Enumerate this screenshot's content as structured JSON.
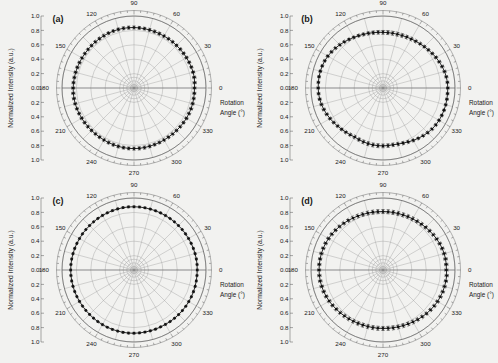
{
  "figure": {
    "background_color": "#f2f2f0",
    "axis_color": "#1a1a1a",
    "data_color": "#111111",
    "grid_color": "#9a9a9a"
  },
  "common": {
    "ylabel": "Normalized Intensity (a.u.)",
    "rotation_label_line1": "Rotation",
    "rotation_label_line2": "Angle (°)",
    "ytick_labels": [
      "1.0",
      "0.8",
      "0.6",
      "0.4",
      "0.2",
      "0.0",
      "0.2",
      "0.4",
      "0.6",
      "0.8",
      "1.0"
    ],
    "angle_ticks": [
      "0",
      "30",
      "60",
      "90",
      "120",
      "150",
      "180",
      "210",
      "240",
      "270",
      "300",
      "330"
    ]
  },
  "panels": [
    {
      "label": "(a)"
    },
    {
      "label": "(b)"
    },
    {
      "label": "(c)"
    },
    {
      "label": "(d)"
    }
  ],
  "chart_data": [
    {
      "type": "line",
      "subplot": "(a)",
      "title": "(a)",
      "xlabel": "Rotation Angle (°)",
      "ylabel": "Normalized Intensity (a.u.)",
      "projection": "polar",
      "rlim": [
        0,
        1.0
      ],
      "r_ticks": [
        0.2,
        0.4,
        0.6,
        0.8,
        1.0
      ],
      "theta_ticks": [
        0,
        30,
        60,
        90,
        120,
        150,
        180,
        210,
        240,
        270,
        300,
        330
      ],
      "grid": true,
      "legend": "none",
      "theta": [
        0,
        5,
        10,
        15,
        20,
        25,
        30,
        35,
        40,
        45,
        50,
        55,
        60,
        65,
        70,
        75,
        80,
        85,
        90,
        95,
        100,
        105,
        110,
        115,
        120,
        125,
        130,
        135,
        140,
        145,
        150,
        155,
        160,
        165,
        170,
        175,
        180,
        185,
        190,
        195,
        200,
        205,
        210,
        215,
        220,
        225,
        230,
        235,
        240,
        245,
        250,
        255,
        260,
        265,
        270,
        275,
        280,
        285,
        290,
        295,
        300,
        305,
        310,
        315,
        320,
        325,
        330,
        335,
        340,
        345,
        350,
        355
      ],
      "r": [
        0.84,
        0.845,
        0.85,
        0.85,
        0.848,
        0.845,
        0.842,
        0.84,
        0.838,
        0.836,
        0.835,
        0.834,
        0.833,
        0.833,
        0.834,
        0.835,
        0.837,
        0.838,
        0.84,
        0.841,
        0.842,
        0.842,
        0.841,
        0.84,
        0.838,
        0.836,
        0.835,
        0.834,
        0.833,
        0.833,
        0.834,
        0.835,
        0.837,
        0.839,
        0.841,
        0.843,
        0.845,
        0.846,
        0.846,
        0.845,
        0.843,
        0.841,
        0.839,
        0.837,
        0.835,
        0.834,
        0.833,
        0.833,
        0.834,
        0.836,
        0.838,
        0.84,
        0.841,
        0.842,
        0.842,
        0.841,
        0.84,
        0.838,
        0.836,
        0.835,
        0.834,
        0.833,
        0.834,
        0.835,
        0.837,
        0.839,
        0.841,
        0.842,
        0.843,
        0.843,
        0.842,
        0.841
      ],
      "r_error": [
        0.02,
        0.022,
        0.022,
        0.02,
        0.019,
        0.02,
        0.021,
        0.022,
        0.022,
        0.021,
        0.02,
        0.02,
        0.021,
        0.022,
        0.022,
        0.021,
        0.02,
        0.02,
        0.021,
        0.022,
        0.022,
        0.021,
        0.02,
        0.02,
        0.021,
        0.022,
        0.022,
        0.021,
        0.02,
        0.02,
        0.021,
        0.022,
        0.022,
        0.021,
        0.02,
        0.02,
        0.021,
        0.022,
        0.022,
        0.021,
        0.02,
        0.02,
        0.021,
        0.022,
        0.022,
        0.021,
        0.02,
        0.02,
        0.021,
        0.022,
        0.022,
        0.021,
        0.02,
        0.02,
        0.021,
        0.022,
        0.022,
        0.021,
        0.02,
        0.02,
        0.021,
        0.022,
        0.022,
        0.021,
        0.02,
        0.02,
        0.021,
        0.022,
        0.022,
        0.021,
        0.02,
        0.02
      ],
      "shape_note": "near-isotropic, radius ~0.84"
    },
    {
      "type": "line",
      "subplot": "(b)",
      "title": "(b)",
      "xlabel": "Rotation Angle (°)",
      "ylabel": "Normalized Intensity (a.u.)",
      "projection": "polar",
      "rlim": [
        0,
        1.0
      ],
      "r_ticks": [
        0.2,
        0.4,
        0.6,
        0.8,
        1.0
      ],
      "theta_ticks": [
        0,
        30,
        60,
        90,
        120,
        150,
        180,
        210,
        240,
        270,
        300,
        330
      ],
      "grid": true,
      "legend": "none",
      "theta": [
        0,
        5,
        10,
        15,
        20,
        25,
        30,
        35,
        40,
        45,
        50,
        55,
        60,
        65,
        70,
        75,
        80,
        85,
        90,
        95,
        100,
        105,
        110,
        115,
        120,
        125,
        130,
        135,
        140,
        145,
        150,
        155,
        160,
        165,
        170,
        175,
        180,
        185,
        190,
        195,
        200,
        205,
        210,
        215,
        220,
        225,
        230,
        235,
        240,
        245,
        250,
        255,
        260,
        265,
        270,
        275,
        280,
        285,
        290,
        295,
        300,
        305,
        310,
        315,
        320,
        325,
        330,
        335,
        340,
        345,
        350,
        355
      ],
      "r": [
        0.9,
        0.898,
        0.893,
        0.885,
        0.874,
        0.862,
        0.849,
        0.836,
        0.823,
        0.812,
        0.802,
        0.793,
        0.786,
        0.78,
        0.776,
        0.773,
        0.772,
        0.772,
        0.773,
        0.776,
        0.78,
        0.786,
        0.793,
        0.802,
        0.812,
        0.823,
        0.836,
        0.849,
        0.862,
        0.874,
        0.885,
        0.893,
        0.898,
        0.901,
        0.902,
        0.901,
        0.9,
        0.898,
        0.893,
        0.885,
        0.874,
        0.862,
        0.849,
        0.836,
        0.823,
        0.812,
        0.802,
        0.793,
        0.786,
        0.79,
        0.796,
        0.8,
        0.803,
        0.804,
        0.804,
        0.803,
        0.801,
        0.806,
        0.815,
        0.826,
        0.84,
        0.853,
        0.866,
        0.878,
        0.888,
        0.895,
        0.899,
        0.901,
        0.902,
        0.902,
        0.901,
        0.9
      ],
      "r_error": [
        0.018,
        0.019,
        0.02,
        0.021,
        0.022,
        0.022,
        0.021,
        0.02,
        0.02,
        0.021,
        0.022,
        0.023,
        0.024,
        0.025,
        0.026,
        0.027,
        0.027,
        0.027,
        0.026,
        0.025,
        0.024,
        0.023,
        0.022,
        0.021,
        0.02,
        0.02,
        0.021,
        0.022,
        0.022,
        0.021,
        0.02,
        0.019,
        0.018,
        0.018,
        0.018,
        0.018,
        0.018,
        0.019,
        0.02,
        0.021,
        0.022,
        0.022,
        0.021,
        0.02,
        0.02,
        0.021,
        0.022,
        0.023,
        0.024,
        0.025,
        0.026,
        0.027,
        0.027,
        0.027,
        0.026,
        0.025,
        0.024,
        0.023,
        0.022,
        0.021,
        0.02,
        0.02,
        0.021,
        0.022,
        0.022,
        0.021,
        0.02,
        0.019,
        0.018,
        0.018,
        0.018,
        0.018
      ],
      "shape_note": "elliptical, elongated along 0-180 axis, max ~0.90 min ~0.77"
    },
    {
      "type": "line",
      "subplot": "(c)",
      "title": "(c)",
      "xlabel": "Rotation Angle (°)",
      "ylabel": "Normalized Intensity (a.u.)",
      "projection": "polar",
      "rlim": [
        0,
        1.0
      ],
      "r_ticks": [
        0.2,
        0.4,
        0.6,
        0.8,
        1.0
      ],
      "theta_ticks": [
        0,
        30,
        60,
        90,
        120,
        150,
        180,
        210,
        240,
        270,
        300,
        330
      ],
      "grid": true,
      "legend": "none",
      "theta": [
        0,
        5,
        10,
        15,
        20,
        25,
        30,
        35,
        40,
        45,
        50,
        55,
        60,
        65,
        70,
        75,
        80,
        85,
        90,
        95,
        100,
        105,
        110,
        115,
        120,
        125,
        130,
        135,
        140,
        145,
        150,
        155,
        160,
        165,
        170,
        175,
        180,
        185,
        190,
        195,
        200,
        205,
        210,
        215,
        220,
        225,
        230,
        235,
        240,
        245,
        250,
        255,
        260,
        265,
        270,
        275,
        280,
        285,
        290,
        295,
        300,
        305,
        310,
        315,
        320,
        325,
        330,
        335,
        340,
        345,
        350,
        355
      ],
      "r": [
        0.878,
        0.879,
        0.879,
        0.878,
        0.877,
        0.876,
        0.875,
        0.874,
        0.874,
        0.873,
        0.873,
        0.873,
        0.874,
        0.874,
        0.875,
        0.876,
        0.877,
        0.878,
        0.878,
        0.879,
        0.879,
        0.878,
        0.877,
        0.876,
        0.875,
        0.874,
        0.873,
        0.873,
        0.873,
        0.874,
        0.874,
        0.875,
        0.876,
        0.877,
        0.878,
        0.879,
        0.879,
        0.879,
        0.878,
        0.877,
        0.876,
        0.875,
        0.874,
        0.873,
        0.873,
        0.873,
        0.874,
        0.875,
        0.876,
        0.877,
        0.878,
        0.878,
        0.879,
        0.879,
        0.878,
        0.877,
        0.876,
        0.875,
        0.874,
        0.873,
        0.873,
        0.874,
        0.875,
        0.876,
        0.877,
        0.878,
        0.878,
        0.879,
        0.879,
        0.879,
        0.878,
        0.878
      ],
      "r_error": [
        0.012,
        0.012,
        0.013,
        0.013,
        0.012,
        0.012,
        0.012,
        0.013,
        0.013,
        0.012,
        0.012,
        0.012,
        0.013,
        0.013,
        0.012,
        0.012,
        0.012,
        0.013,
        0.013,
        0.012,
        0.012,
        0.012,
        0.013,
        0.013,
        0.012,
        0.012,
        0.012,
        0.013,
        0.013,
        0.012,
        0.012,
        0.012,
        0.013,
        0.013,
        0.012,
        0.012,
        0.012,
        0.013,
        0.013,
        0.012,
        0.012,
        0.012,
        0.013,
        0.013,
        0.012,
        0.012,
        0.012,
        0.013,
        0.013,
        0.012,
        0.012,
        0.012,
        0.013,
        0.013,
        0.012,
        0.012,
        0.012,
        0.013,
        0.013,
        0.012,
        0.012,
        0.012,
        0.013,
        0.013,
        0.012,
        0.012,
        0.012,
        0.013,
        0.013,
        0.012,
        0.012,
        0.012
      ],
      "shape_note": "isotropic circle, radius ~0.88, small error bars"
    },
    {
      "type": "line",
      "subplot": "(d)",
      "title": "(d)",
      "xlabel": "Rotation Angle (°)",
      "ylabel": "Normalized Intensity (a.u.)",
      "projection": "polar",
      "rlim": [
        0,
        1.0
      ],
      "r_ticks": [
        0.2,
        0.4,
        0.6,
        0.8,
        1.0
      ],
      "theta_ticks": [
        0,
        30,
        60,
        90,
        120,
        150,
        180,
        210,
        240,
        270,
        300,
        330
      ],
      "grid": true,
      "legend": "none",
      "theta": [
        0,
        5,
        10,
        15,
        20,
        25,
        30,
        35,
        40,
        45,
        50,
        55,
        60,
        65,
        70,
        75,
        80,
        85,
        90,
        95,
        100,
        105,
        110,
        115,
        120,
        125,
        130,
        135,
        140,
        145,
        150,
        155,
        160,
        165,
        170,
        175,
        180,
        185,
        190,
        195,
        200,
        205,
        210,
        215,
        220,
        225,
        230,
        235,
        240,
        245,
        250,
        255,
        260,
        265,
        270,
        275,
        280,
        285,
        290,
        295,
        300,
        305,
        310,
        315,
        320,
        325,
        330,
        335,
        340,
        345,
        350,
        355
      ],
      "r": [
        0.88,
        0.882,
        0.882,
        0.88,
        0.875,
        0.869,
        0.861,
        0.853,
        0.845,
        0.838,
        0.831,
        0.826,
        0.821,
        0.818,
        0.815,
        0.813,
        0.812,
        0.812,
        0.812,
        0.813,
        0.815,
        0.818,
        0.822,
        0.827,
        0.833,
        0.84,
        0.847,
        0.854,
        0.861,
        0.868,
        0.874,
        0.879,
        0.883,
        0.886,
        0.887,
        0.888,
        0.888,
        0.887,
        0.885,
        0.881,
        0.876,
        0.87,
        0.863,
        0.855,
        0.847,
        0.84,
        0.833,
        0.827,
        0.822,
        0.818,
        0.815,
        0.813,
        0.812,
        0.812,
        0.812,
        0.813,
        0.815,
        0.818,
        0.822,
        0.827,
        0.833,
        0.84,
        0.847,
        0.855,
        0.862,
        0.869,
        0.875,
        0.879,
        0.883,
        0.885,
        0.887,
        0.888
      ],
      "r_error": [
        0.022,
        0.023,
        0.024,
        0.024,
        0.024,
        0.024,
        0.024,
        0.024,
        0.025,
        0.025,
        0.026,
        0.026,
        0.027,
        0.027,
        0.028,
        0.028,
        0.028,
        0.028,
        0.028,
        0.028,
        0.028,
        0.027,
        0.027,
        0.026,
        0.026,
        0.025,
        0.025,
        0.024,
        0.024,
        0.024,
        0.024,
        0.024,
        0.023,
        0.023,
        0.022,
        0.022,
        0.022,
        0.023,
        0.024,
        0.024,
        0.024,
        0.024,
        0.024,
        0.024,
        0.025,
        0.025,
        0.026,
        0.026,
        0.027,
        0.027,
        0.028,
        0.028,
        0.028,
        0.028,
        0.028,
        0.028,
        0.028,
        0.027,
        0.027,
        0.026,
        0.026,
        0.025,
        0.025,
        0.024,
        0.024,
        0.024,
        0.024,
        0.024,
        0.023,
        0.023,
        0.022,
        0.022
      ],
      "shape_note": "slightly elliptical, elongated 0-180, max ~0.89 min ~0.81, large error bars"
    }
  ]
}
